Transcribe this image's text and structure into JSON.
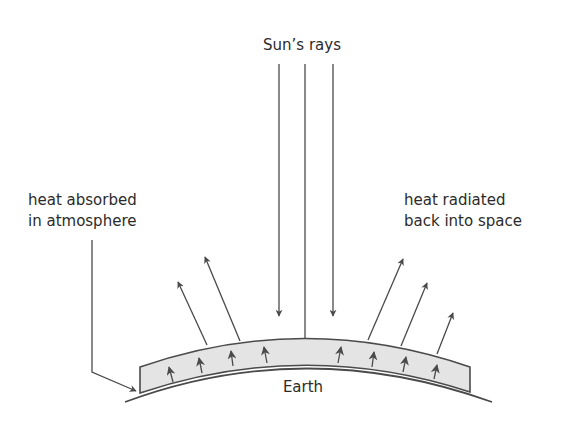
{
  "diagram": {
    "labels": {
      "sun_rays": "Sun’s rays",
      "absorbed_line1": "heat absorbed",
      "absorbed_line2": "in atmosphere",
      "radiated_line1": "heat radiated",
      "radiated_line2": "back into space",
      "earth": "Earth"
    },
    "colors": {
      "stroke": "#4a4a4a",
      "text": "#2b2b2b",
      "atmosphere_fill": "#e4e4e4",
      "background": "#ffffff"
    },
    "elements": {
      "sun_rays_count": 3,
      "outgoing_arrows_count": 5,
      "trapped_arrows_count": 8
    }
  }
}
